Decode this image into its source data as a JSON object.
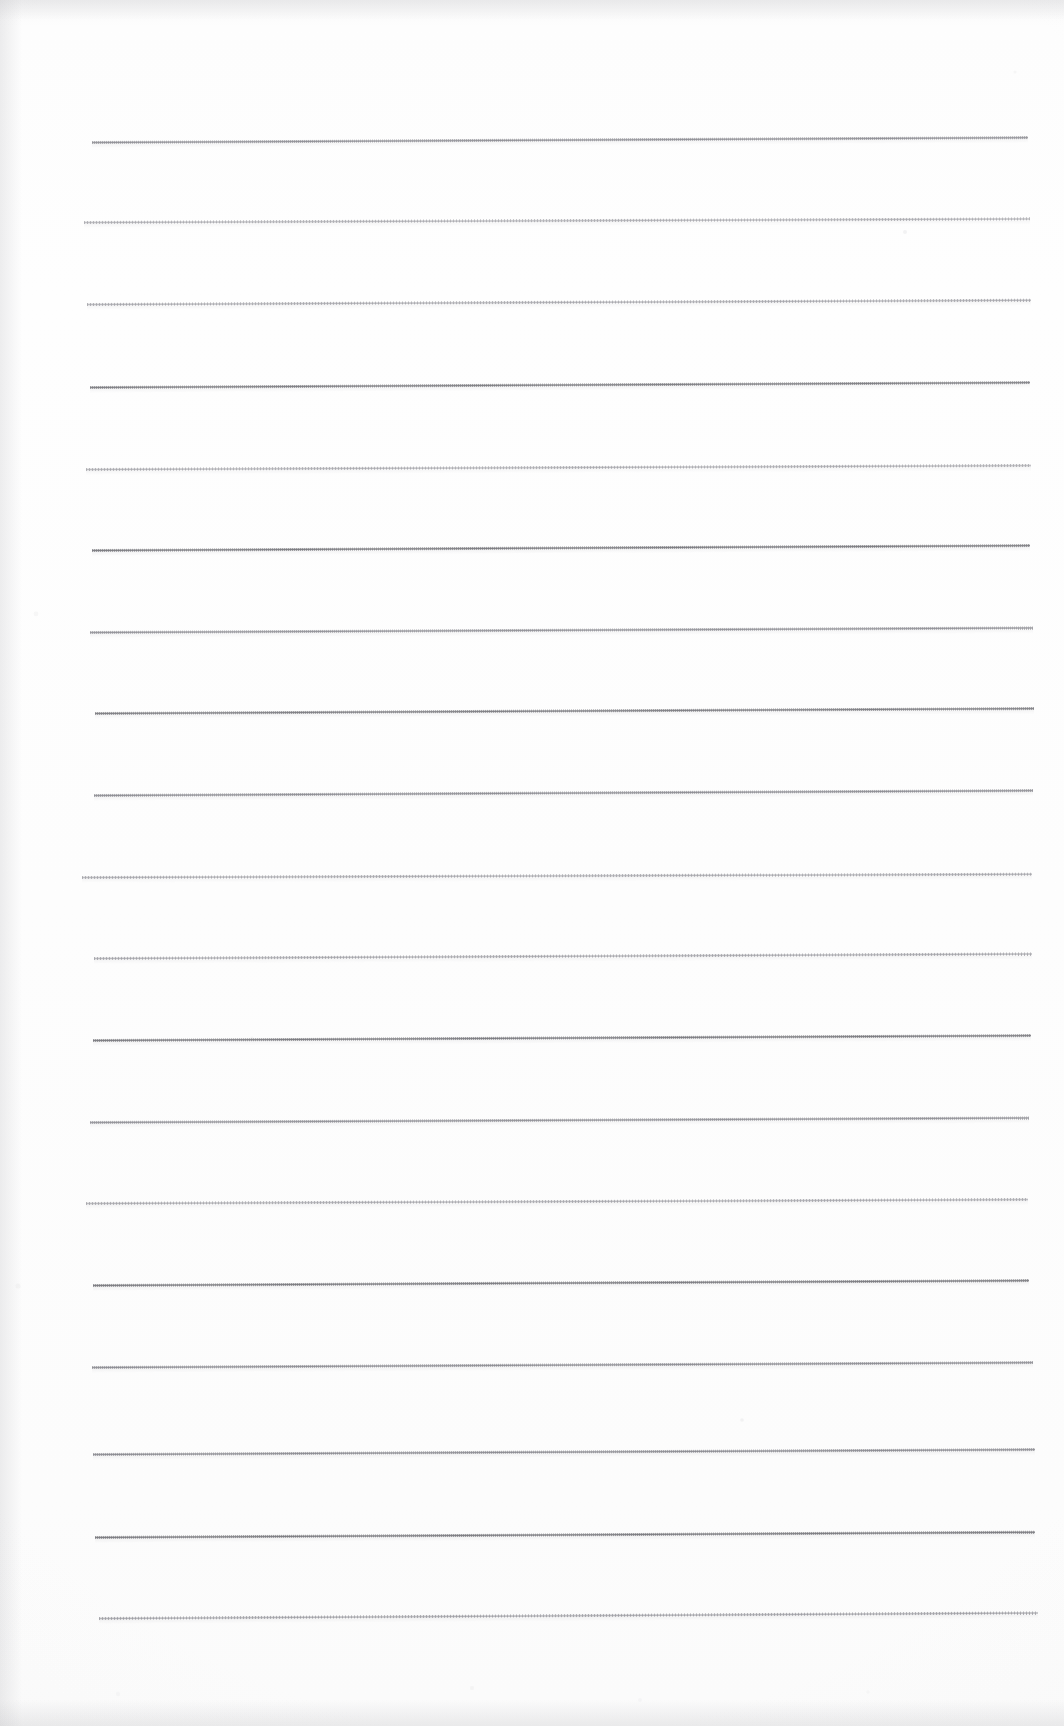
{
  "document": {
    "kind": "scanned-ruled-paper",
    "title": "Blank Ruled Notebook Page",
    "page_width": 1064,
    "page_height": 1726,
    "background_color": "#fdfdfd",
    "has_text": false,
    "has_handwriting": false,
    "content_note": "Blank lined writing paper, no text present"
  },
  "ruling": {
    "line_color": "#8b8b91",
    "line_color_light": "#b2b2b8",
    "line_count": 18,
    "first_line_y": 141,
    "line_spacing": 82,
    "left_margin_x": 92,
    "right_margin_x": 1033,
    "line_thickness": 3,
    "texture": "dithered-halftone",
    "lines": [
      {
        "y": 141,
        "x1": 92,
        "x2": 1028,
        "tilt": -0.3,
        "weight": "medium",
        "opacity": 0.82
      },
      {
        "y": 221,
        "x1": 84,
        "x2": 1030,
        "tilt": -0.22,
        "weight": "dotted",
        "opacity": 0.7
      },
      {
        "y": 303,
        "x1": 87,
        "x2": 1031,
        "tilt": -0.26,
        "weight": "dotted",
        "opacity": 0.74
      },
      {
        "y": 386,
        "x1": 90,
        "x2": 1030,
        "tilt": -0.3,
        "weight": "solid",
        "opacity": 0.86
      },
      {
        "y": 468,
        "x1": 86,
        "x2": 1031,
        "tilt": -0.24,
        "weight": "dotted",
        "opacity": 0.72
      },
      {
        "y": 549,
        "x1": 92,
        "x2": 1030,
        "tilt": -0.3,
        "weight": "solid",
        "opacity": 0.88
      },
      {
        "y": 631,
        "x1": 90,
        "x2": 1033,
        "tilt": -0.28,
        "weight": "medium",
        "opacity": 0.8
      },
      {
        "y": 712,
        "x1": 95,
        "x2": 1034,
        "tilt": -0.3,
        "weight": "solid",
        "opacity": 0.86
      },
      {
        "y": 794,
        "x1": 94,
        "x2": 1033,
        "tilt": -0.3,
        "weight": "medium",
        "opacity": 0.84
      },
      {
        "y": 876,
        "x1": 82,
        "x2": 1032,
        "tilt": -0.2,
        "weight": "dotted",
        "opacity": 0.74
      },
      {
        "y": 957,
        "x1": 94,
        "x2": 1032,
        "tilt": -0.28,
        "weight": "dotted",
        "opacity": 0.76
      },
      {
        "y": 1039,
        "x1": 93,
        "x2": 1031,
        "tilt": -0.3,
        "weight": "solid",
        "opacity": 0.88
      },
      {
        "y": 1121,
        "x1": 90,
        "x2": 1029,
        "tilt": -0.28,
        "weight": "medium",
        "opacity": 0.8
      },
      {
        "y": 1202,
        "x1": 86,
        "x2": 1028,
        "tilt": -0.24,
        "weight": "dotted",
        "opacity": 0.74
      },
      {
        "y": 1284,
        "x1": 93,
        "x2": 1029,
        "tilt": -0.3,
        "weight": "solid",
        "opacity": 0.88
      },
      {
        "y": 1366,
        "x1": 92,
        "x2": 1033,
        "tilt": -0.3,
        "weight": "medium",
        "opacity": 0.84
      },
      {
        "y": 1453,
        "x1": 93,
        "x2": 1035,
        "tilt": -0.3,
        "weight": "medium",
        "opacity": 0.86
      },
      {
        "y": 1536,
        "x1": 95,
        "x2": 1035,
        "tilt": -0.32,
        "weight": "solid",
        "opacity": 0.88
      },
      {
        "y": 1617,
        "x1": 99,
        "x2": 1038,
        "tilt": -0.34,
        "weight": "dotted",
        "opacity": 0.8
      }
    ]
  },
  "artifacts": {
    "description": "Scanner edge shading and faint toner speckles",
    "speckles": [
      {
        "x": 905,
        "y": 232,
        "r": 2.0,
        "opacity": 0.22
      },
      {
        "x": 742,
        "y": 1420,
        "r": 1.8,
        "opacity": 0.2
      },
      {
        "x": 252,
        "y": 1038,
        "r": 1.4,
        "opacity": 0.16
      },
      {
        "x": 36,
        "y": 614,
        "r": 2.4,
        "opacity": 0.13
      },
      {
        "x": 18,
        "y": 1286,
        "r": 2.6,
        "opacity": 0.13
      },
      {
        "x": 1015,
        "y": 72,
        "r": 1.6,
        "opacity": 0.12
      },
      {
        "x": 472,
        "y": 1688,
        "r": 2.2,
        "opacity": 0.12
      },
      {
        "x": 640,
        "y": 1700,
        "r": 2.0,
        "opacity": 0.11
      },
      {
        "x": 118,
        "y": 1694,
        "r": 2.2,
        "opacity": 0.11
      },
      {
        "x": 868,
        "y": 1692,
        "r": 1.8,
        "opacity": 0.1
      }
    ]
  }
}
